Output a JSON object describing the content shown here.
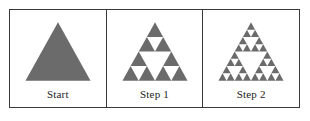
{
  "figure": {
    "frame_border_color": "#3a3a3a",
    "background_color": "#ffffff",
    "fill_color": "#6b6b6b",
    "panels": [
      {
        "label": "Start",
        "icon_name": "solid-triangle",
        "depth": 0,
        "triangle_count": 1,
        "description": "Solid filled equilateral triangle"
      },
      {
        "label": "Step 1",
        "icon_name": "sierpinski-triangle-depth-2",
        "depth": 2,
        "triangle_count": 9,
        "description": "Sierpinski triangle after two subdivisions"
      },
      {
        "label": "Step 2",
        "icon_name": "sierpinski-triangle-depth-3",
        "depth": 3,
        "triangle_count": 27,
        "description": "Sierpinski triangle after three subdivisions"
      }
    ]
  },
  "chart_data": {
    "type": "diagram",
    "categories": [
      "Start",
      "Step 1",
      "Step 2"
    ],
    "values": [
      1,
      9,
      27
    ],
    "series": [
      {
        "name": "recursion depth",
        "values": [
          0,
          2,
          3
        ]
      },
      {
        "name": "filled triangles",
        "values": [
          1,
          9,
          27
        ]
      }
    ],
    "xlabel": "",
    "ylabel": "",
    "legend": "none",
    "grid": false
  }
}
